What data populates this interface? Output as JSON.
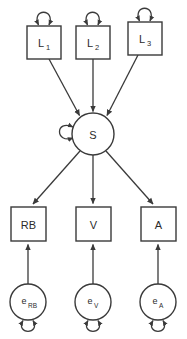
{
  "diagram": {
    "type": "path-diagram",
    "subtype": "structural-equation-model",
    "background_color": "#ffffff",
    "stroke_color": "#3a3a3a",
    "text_color": "#2b2b2b",
    "latent_nodes": [
      {
        "id": "L1",
        "label": "L",
        "subscript": "1",
        "shape": "rectangle",
        "x": 27,
        "y": 26,
        "w": 34,
        "h": 33,
        "self_loop": "top"
      },
      {
        "id": "L2",
        "label": "L",
        "subscript": "2",
        "shape": "rectangle",
        "x": 76,
        "y": 26,
        "w": 34,
        "h": 33,
        "self_loop": "top"
      },
      {
        "id": "L3",
        "label": "L",
        "subscript": "3",
        "shape": "rectangle",
        "x": 128,
        "y": 22,
        "w": 34,
        "h": 33,
        "self_loop": "top"
      }
    ],
    "factor_node": {
      "id": "S",
      "label": "S",
      "shape": "circle",
      "cx": 93,
      "cy": 134,
      "r": 21,
      "self_loop": "left"
    },
    "observed_nodes": [
      {
        "id": "RB",
        "label": "RB",
        "shape": "rectangle",
        "x": 11,
        "y": 207,
        "w": 35,
        "h": 34
      },
      {
        "id": "V",
        "label": "V",
        "shape": "rectangle",
        "x": 76,
        "y": 207,
        "w": 35,
        "h": 34
      },
      {
        "id": "A",
        "label": "A",
        "shape": "rectangle",
        "x": 141,
        "y": 207,
        "w": 35,
        "h": 34
      }
    ],
    "error_nodes": [
      {
        "id": "eRB",
        "label": "e",
        "subscript": "RB",
        "shape": "circle",
        "cx": 28,
        "cy": 302,
        "r": 18,
        "self_loop": "bottom"
      },
      {
        "id": "eV",
        "label": "e",
        "subscript": "V",
        "shape": "circle",
        "cx": 93,
        "cy": 302,
        "r": 18,
        "self_loop": "bottom"
      },
      {
        "id": "eA",
        "label": "e",
        "subscript": "A",
        "shape": "circle",
        "cx": 158,
        "cy": 302,
        "r": 18,
        "self_loop": "bottom"
      }
    ],
    "edges": [
      {
        "from": "L1",
        "to": "S",
        "style": "single-arrow"
      },
      {
        "from": "L2",
        "to": "S",
        "style": "single-arrow"
      },
      {
        "from": "L3",
        "to": "S",
        "style": "single-arrow"
      },
      {
        "from": "S",
        "to": "RB",
        "style": "single-arrow"
      },
      {
        "from": "S",
        "to": "V",
        "style": "single-arrow"
      },
      {
        "from": "S",
        "to": "A",
        "style": "single-arrow"
      },
      {
        "from": "eRB",
        "to": "RB",
        "style": "single-arrow"
      },
      {
        "from": "eV",
        "to": "V",
        "style": "single-arrow"
      },
      {
        "from": "eA",
        "to": "A",
        "style": "single-arrow"
      }
    ],
    "variance_loops": [
      {
        "node": "L1",
        "position": "top"
      },
      {
        "node": "L2",
        "position": "top"
      },
      {
        "node": "L3",
        "position": "top"
      },
      {
        "node": "S",
        "position": "left"
      },
      {
        "node": "eRB",
        "position": "bottom"
      },
      {
        "node": "eV",
        "position": "bottom"
      },
      {
        "node": "eA",
        "position": "bottom"
      }
    ]
  }
}
